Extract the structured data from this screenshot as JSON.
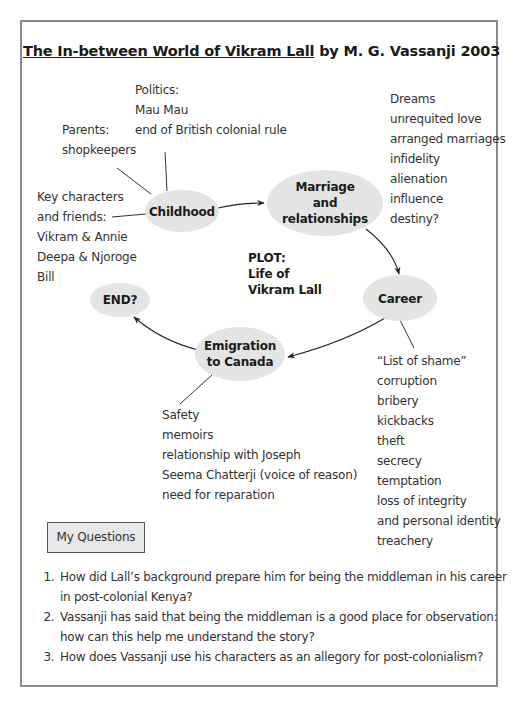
{
  "title": {
    "book_title": "The In-between World of Vikram Lall",
    "byline": " by M. G. Vassanji 2003"
  },
  "nodes": {
    "childhood": "Childhood",
    "marriage": [
      "Marriage",
      "and",
      "relationships"
    ],
    "career": "Career",
    "emigration": [
      "Emigration",
      "to Canada"
    ],
    "end": "END?"
  },
  "plot": [
    "PLOT:",
    "Life of",
    "Vikram Lall"
  ],
  "notes": {
    "politics": [
      "Politics:",
      "Mau Mau",
      "end of British colonial rule"
    ],
    "parents": [
      "Parents:",
      "shopkeepers"
    ],
    "key_characters": [
      "Key characters",
      "and friends:",
      "Vikram & Annie",
      "Deepa & Njoroge",
      "Bill"
    ],
    "marriage_themes": [
      "Dreams",
      "unrequited love",
      "arranged marriages",
      "infidelity",
      "alienation",
      "influence",
      "destiny?"
    ],
    "career_themes": [
      "“List of shame”",
      "corruption",
      "bribery",
      "kickbacks",
      "theft",
      "secrecy",
      "temptation",
      "loss of integrity",
      "and personal identity",
      "treachery"
    ],
    "emigration_themes": [
      "Safety",
      "memoirs",
      "relationship with Joseph",
      "Seema Chatterji (voice of reason)",
      "need for reparation"
    ]
  },
  "questions": {
    "heading": "My Questions",
    "items": [
      "How did Lall’s background prepare him for being the middleman in his career in post-colonial Kenya?",
      "Vassanji has said that being the middleman is a good place for observation: how can this help me understand the story?",
      "How does Vassanji use his characters as an allegory for post-colonialism?"
    ]
  },
  "colors": {
    "node_fill": "#e4e4e4",
    "frame": "#8a8a8a",
    "line": "#222222"
  }
}
